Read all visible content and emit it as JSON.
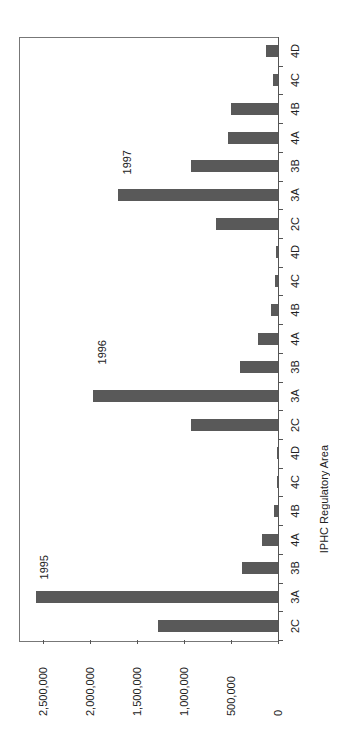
{
  "chart_data": {
    "type": "bar",
    "orientation": "vertical (image rotated 90 degrees clockwise)",
    "title": "",
    "xlabel": "IPHC Regulatory Area",
    "ylabel": "Pounds Transfered",
    "ylim": [
      0,
      2750000
    ],
    "yticks": [
      0,
      500000,
      1000000,
      1500000,
      2000000,
      2500000
    ],
    "ytick_labels": [
      "0",
      "500,000",
      "1,000,000",
      "1,500,000",
      "2,000,000",
      "2,500,000"
    ],
    "grid": false,
    "legend": null,
    "categories": [
      "2C",
      "3A",
      "3B",
      "4A",
      "4B",
      "4C",
      "4D",
      "2C",
      "3A",
      "3B",
      "4A",
      "4B",
      "4C",
      "4D",
      "2C",
      "3A",
      "3B",
      "4A",
      "4B",
      "4C",
      "4D"
    ],
    "groups": [
      {
        "year": "1995",
        "areas": [
          "2C",
          "3A",
          "3B",
          "4A",
          "4B",
          "4C",
          "4D"
        ],
        "values": [
          1285000,
          2580000,
          390000,
          180000,
          50000,
          15000,
          15000
        ]
      },
      {
        "year": "1996",
        "areas": [
          "2C",
          "3A",
          "3B",
          "4A",
          "4B",
          "4C",
          "4D"
        ],
        "values": [
          935000,
          1975000,
          410000,
          220000,
          80000,
          40000,
          35000
        ]
      },
      {
        "year": "1997",
        "areas": [
          "2C",
          "3A",
          "3B",
          "4A",
          "4B",
          "4C",
          "4D"
        ],
        "values": [
          670000,
          1710000,
          935000,
          545000,
          510000,
          65000,
          135000
        ]
      }
    ],
    "values": [
      1285000,
      2580000,
      390000,
      180000,
      50000,
      15000,
      15000,
      935000,
      1975000,
      410000,
      220000,
      80000,
      40000,
      35000,
      670000,
      1710000,
      935000,
      545000,
      510000,
      65000,
      135000
    ],
    "annotations": [
      "1995",
      "1996",
      "1997"
    ],
    "bar_color": "#595959"
  },
  "labels": {
    "x_axis_title": "IPHC Regulatory Area",
    "y_axis_title": "Pounds Transfered",
    "year_1995": "1995",
    "year_1996": "1996",
    "year_1997": "1997"
  }
}
